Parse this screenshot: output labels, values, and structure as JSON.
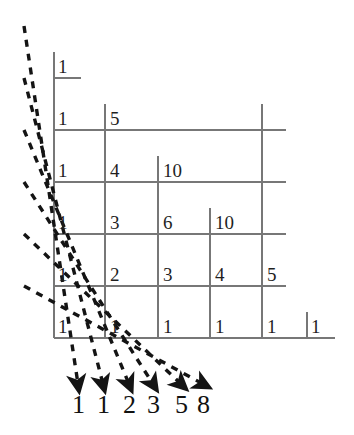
{
  "figure": {
    "colors": {
      "grid_line": "#777777",
      "dashed_line": "#1a1a1a",
      "text": "#1f1f1f",
      "background": "#ffffff"
    },
    "grid": {
      "columns_x": [
        54,
        105,
        158,
        210,
        262,
        307
      ],
      "rows_y": [
        78,
        130,
        182,
        234,
        286,
        338
      ],
      "baseline_right_x": 335
    }
  },
  "chart_data": {
    "type": "table",
    "xlabel": "",
    "ylabel": "",
    "grid": "on",
    "legend": "none",
    "rows": [
      {
        "row": 0,
        "values": [
          "1"
        ]
      },
      {
        "row": 1,
        "values": [
          "1",
          "5"
        ]
      },
      {
        "row": 2,
        "values": [
          "1",
          "4",
          "10"
        ]
      },
      {
        "row": 3,
        "values": [
          "1",
          "3",
          "6",
          "10"
        ]
      },
      {
        "row": 4,
        "values": [
          "1",
          "2",
          "3",
          "4",
          "5"
        ]
      },
      {
        "row": 5,
        "values": [
          "1",
          "1",
          "1",
          "1",
          "1",
          "1"
        ]
      }
    ],
    "diagonal_sums": [
      "1",
      "1",
      "2",
      "3",
      "5",
      "8"
    ],
    "diagonal_sums_label": "Fibonacci numbers formed by summing along the dashed diagonals"
  },
  "cells": [
    {
      "id": "r0c0",
      "value": "1",
      "x": 58,
      "y": 57
    },
    {
      "id": "r1c0",
      "value": "1",
      "x": 58,
      "y": 109
    },
    {
      "id": "r1c1",
      "value": "5",
      "x": 110,
      "y": 109
    },
    {
      "id": "r2c0",
      "value": "1",
      "x": 58,
      "y": 161
    },
    {
      "id": "r2c1",
      "value": "4",
      "x": 110,
      "y": 161
    },
    {
      "id": "r2c2",
      "value": "10",
      "x": 163,
      "y": 161
    },
    {
      "id": "r3c0",
      "value": "1",
      "x": 58,
      "y": 213
    },
    {
      "id": "r3c1",
      "value": "3",
      "x": 110,
      "y": 213
    },
    {
      "id": "r3c2",
      "value": "6",
      "x": 163,
      "y": 213
    },
    {
      "id": "r3c3",
      "value": "10",
      "x": 215,
      "y": 213
    },
    {
      "id": "r4c0",
      "value": "1",
      "x": 58,
      "y": 265
    },
    {
      "id": "r4c1",
      "value": "2",
      "x": 110,
      "y": 265
    },
    {
      "id": "r4c2",
      "value": "3",
      "x": 163,
      "y": 265
    },
    {
      "id": "r4c3",
      "value": "4",
      "x": 215,
      "y": 265
    },
    {
      "id": "r4c4",
      "value": "5",
      "x": 267,
      "y": 265
    },
    {
      "id": "r5c0",
      "value": "1",
      "x": 58,
      "y": 317
    },
    {
      "id": "r5c1",
      "value": "1",
      "x": 110,
      "y": 317
    },
    {
      "id": "r5c2",
      "value": "1",
      "x": 163,
      "y": 317
    },
    {
      "id": "r5c3",
      "value": "1",
      "x": 215,
      "y": 317
    },
    {
      "id": "r5c4",
      "value": "1",
      "x": 267,
      "y": 317
    },
    {
      "id": "r5c5",
      "value": "1",
      "x": 311,
      "y": 317
    }
  ],
  "sums": [
    {
      "id": "s0",
      "value": "1",
      "x": 72,
      "y": 392
    },
    {
      "id": "s1",
      "value": "1",
      "x": 97,
      "y": 392
    },
    {
      "id": "s2",
      "value": "2",
      "x": 123,
      "y": 392
    },
    {
      "id": "s3",
      "value": "3",
      "x": 147,
      "y": 392
    },
    {
      "id": "s4",
      "value": "5",
      "x": 175,
      "y": 392
    },
    {
      "id": "s5",
      "value": "8",
      "x": 197,
      "y": 392
    }
  ]
}
